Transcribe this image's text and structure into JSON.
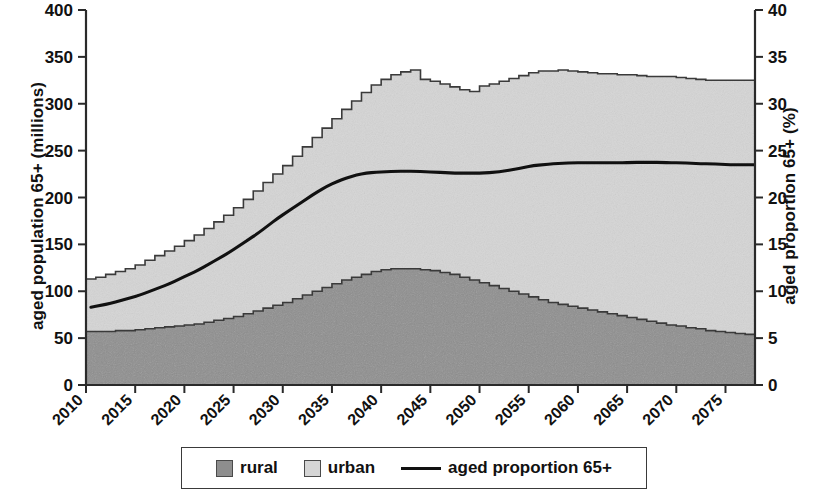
{
  "chart_data": {
    "type": "area",
    "title": "",
    "subtitle": "",
    "xlabel": "",
    "ylabel": "aged population 65+ (millions)",
    "y2label": "aged proportion 65+ (%)",
    "xlim": [
      2010,
      2078
    ],
    "ylim": [
      0,
      400
    ],
    "y2lim": [
      0,
      40
    ],
    "ytick_labels": [
      "0",
      "50",
      "100",
      "150",
      "200",
      "250",
      "300",
      "350",
      "400"
    ],
    "ytick_values": [
      0,
      50,
      100,
      150,
      200,
      250,
      300,
      350,
      400
    ],
    "y2tick_labels": [
      "0",
      "5",
      "10",
      "15",
      "20",
      "25",
      "30",
      "35",
      "40"
    ],
    "y2tick_values": [
      0,
      5,
      10,
      15,
      20,
      25,
      30,
      35,
      40
    ],
    "xtick_labels": [
      "2010",
      "2015",
      "2020",
      "2025",
      "2030",
      "2035",
      "2040",
      "2045",
      "2050",
      "2055",
      "2060",
      "2065",
      "2070",
      "2075"
    ],
    "xtick_values": [
      2010,
      2015,
      2020,
      2025,
      2030,
      2035,
      2040,
      2045,
      2050,
      2055,
      2060,
      2065,
      2070,
      2075
    ],
    "grid": false,
    "legend_position": "bottom",
    "x": [
      2010,
      2011,
      2012,
      2013,
      2014,
      2015,
      2016,
      2017,
      2018,
      2019,
      2020,
      2021,
      2022,
      2023,
      2024,
      2025,
      2026,
      2027,
      2028,
      2029,
      2030,
      2031,
      2032,
      2033,
      2034,
      2035,
      2036,
      2037,
      2038,
      2039,
      2040,
      2041,
      2042,
      2043,
      2044,
      2045,
      2046,
      2047,
      2048,
      2049,
      2050,
      2051,
      2052,
      2053,
      2054,
      2055,
      2056,
      2057,
      2058,
      2059,
      2060,
      2061,
      2062,
      2063,
      2064,
      2065,
      2066,
      2067,
      2068,
      2069,
      2070,
      2071,
      2072,
      2073,
      2074,
      2075,
      2076,
      2077,
      2078
    ],
    "series": [
      {
        "name": "rural",
        "axis": "left",
        "units": "millions",
        "color": "#8e8e8e",
        "values": [
          57,
          57,
          57,
          58,
          58,
          59,
          60,
          61,
          62,
          63,
          64,
          65,
          67,
          69,
          71,
          73,
          76,
          79,
          82,
          85,
          88,
          92,
          96,
          100,
          104,
          108,
          112,
          115,
          118,
          121,
          123,
          124,
          124,
          124,
          123,
          122,
          120,
          118,
          115,
          112,
          109,
          106,
          103,
          100,
          97,
          94,
          91,
          88,
          86,
          84,
          82,
          80,
          78,
          76,
          74,
          72,
          70,
          68,
          66,
          64,
          63,
          61,
          60,
          58,
          57,
          56,
          55,
          54,
          52
        ]
      },
      {
        "name": "urban",
        "axis": "left",
        "units": "millions",
        "color": "#d5d5d5",
        "values": [
          56,
          58,
          61,
          63,
          66,
          69,
          73,
          77,
          81,
          85,
          90,
          95,
          100,
          105,
          110,
          116,
          122,
          128,
          134,
          140,
          146,
          152,
          158,
          164,
          170,
          176,
          182,
          188,
          194,
          199,
          203,
          207,
          210,
          212,
          203,
          202,
          201,
          200,
          200,
          201,
          210,
          215,
          221,
          227,
          233,
          239,
          244,
          247,
          250,
          251,
          252,
          253,
          254,
          256,
          257,
          259,
          260,
          261,
          263,
          265,
          265,
          266,
          266,
          267,
          268,
          269,
          270,
          271,
          275
        ]
      },
      {
        "name": "total",
        "axis": "left",
        "units": "millions",
        "color": "#3a3a3a",
        "values": [
          113,
          115,
          118,
          121,
          124,
          128,
          133,
          138,
          143,
          148,
          154,
          160,
          167,
          174,
          181,
          189,
          198,
          207,
          216,
          225,
          234,
          244,
          254,
          264,
          274,
          284,
          294,
          303,
          312,
          320,
          326,
          331,
          334,
          336,
          326,
          324,
          321,
          318,
          315,
          313,
          319,
          321,
          324,
          327,
          330,
          333,
          335,
          335,
          336,
          335,
          334,
          333,
          332,
          332,
          331,
          331,
          330,
          329,
          329,
          329,
          328,
          327,
          326,
          325,
          325,
          325,
          325,
          325,
          327
        ]
      },
      {
        "name": "aged proportion 65+",
        "axis": "right",
        "units": "%",
        "color": "#111111",
        "values": [
          8.3,
          8.5,
          8.7,
          9.0,
          9.3,
          9.6,
          10.0,
          10.4,
          10.8,
          11.3,
          11.8,
          12.3,
          12.9,
          13.5,
          14.1,
          14.8,
          15.5,
          16.2,
          17.0,
          17.8,
          18.5,
          19.2,
          19.9,
          20.6,
          21.2,
          21.7,
          22.1,
          22.4,
          22.6,
          22.7,
          22.75,
          22.8,
          22.8,
          22.8,
          22.75,
          22.7,
          22.65,
          22.6,
          22.6,
          22.6,
          22.6,
          22.7,
          22.8,
          23.0,
          23.2,
          23.4,
          23.5,
          23.6,
          23.65,
          23.7,
          23.7,
          23.7,
          23.7,
          23.7,
          23.7,
          23.75,
          23.75,
          23.75,
          23.75,
          23.7,
          23.7,
          23.65,
          23.6,
          23.6,
          23.55,
          23.5,
          23.5,
          23.5,
          23.5
        ]
      }
    ],
    "annotations": []
  },
  "legend": {
    "items": [
      {
        "label": "rural",
        "marker": "filled-square",
        "color": "#8e8e8e"
      },
      {
        "label": "urban",
        "marker": "filled-square",
        "color": "#d5d5d5"
      },
      {
        "label": "aged proportion 65+",
        "marker": "line",
        "color": "#111111"
      }
    ]
  }
}
